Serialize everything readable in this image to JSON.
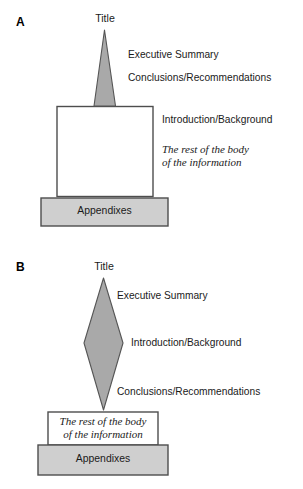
{
  "figure": {
    "colors": {
      "shape_fill_dark": "#a9a9a9",
      "shape_fill_light": "#cfcfcf",
      "shape_stroke": "#555555",
      "box_stroke": "#4d4d4d",
      "box_fill_white": "#ffffff",
      "text": "#1a1a1a",
      "background": "#ffffff"
    }
  },
  "panels": [
    {
      "letter": "A",
      "title_label": "Title",
      "shape": "narrow-triangle",
      "side_labels": [
        "Executive Summary",
        "Conclusions/Recommendations",
        "Introduction/Background"
      ],
      "body_note": "The rest of the body\nof the information",
      "body_note_placement": "outside-right",
      "appendix_label": "Appendixes"
    },
    {
      "letter": "B",
      "title_label": "Title",
      "shape": "diamond",
      "side_labels": [
        "Executive Summary",
        "Introduction/Background",
        "Conclusions/Recommendations"
      ],
      "body_note": "The rest of the body\nof the information",
      "body_note_placement": "inside-box",
      "appendix_label": "Appendixes"
    }
  ]
}
